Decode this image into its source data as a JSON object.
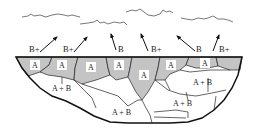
{
  "diagram": {
    "colors": {
      "shaded_grain": "#c4c4c4",
      "outline": "#111111",
      "background": "#ffffff"
    },
    "arrows": [
      {
        "label": "B+",
        "direction": "up-right"
      },
      {
        "label": "B+",
        "direction": "up-right"
      },
      {
        "label": "B",
        "direction": "up-left"
      },
      {
        "label": "B+",
        "direction": "up-left"
      },
      {
        "label": "B",
        "direction": "up-left"
      },
      {
        "label": "B+",
        "direction": "up-right"
      }
    ],
    "surface_grains": [
      {
        "label": "A"
      },
      {
        "label": "A"
      },
      {
        "label": "A"
      },
      {
        "label": "A"
      },
      {
        "label": "A"
      },
      {
        "label": "A"
      },
      {
        "label": "A"
      }
    ],
    "bulk_grains": [
      {
        "label": "A + B"
      },
      {
        "label": "A + B"
      },
      {
        "label": "A + B"
      },
      {
        "label": "A + B"
      }
    ],
    "waves": [
      "wave-1",
      "wave-2",
      "wave-3",
      "wave-4"
    ]
  }
}
